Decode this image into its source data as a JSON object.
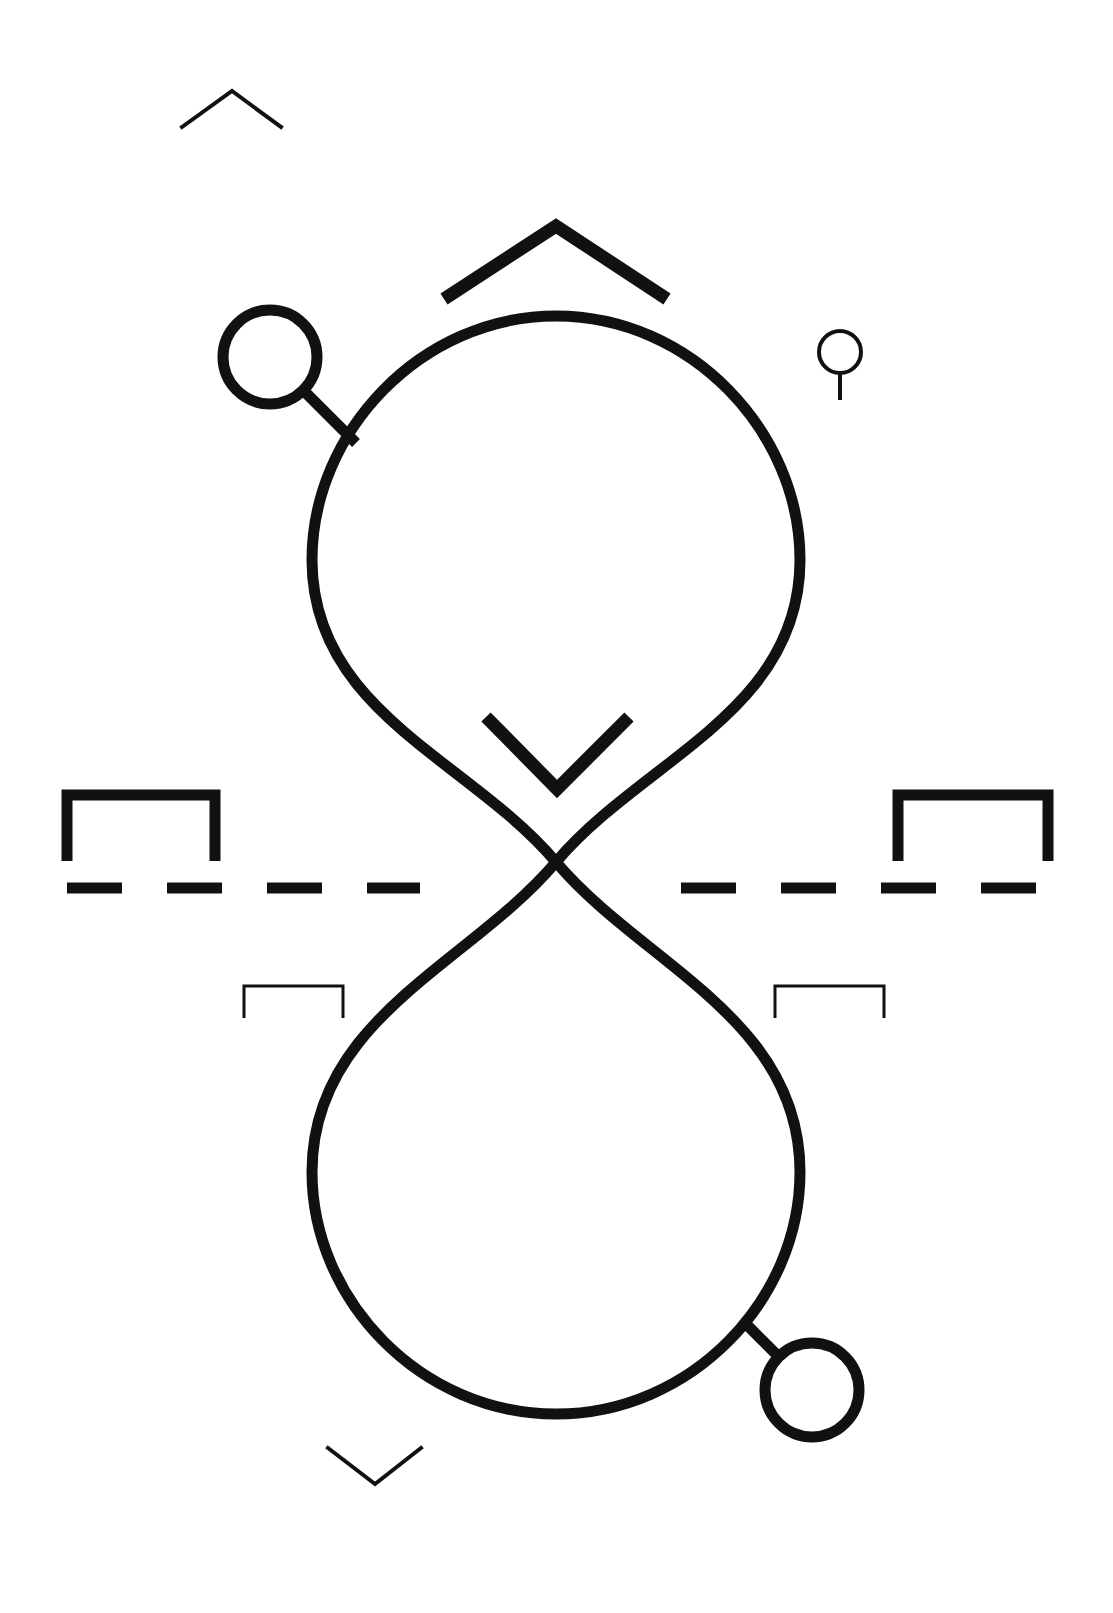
{
  "canvas": {
    "width": 1113,
    "height": 1613,
    "background_color": "#ffffff",
    "stroke_color": "#111111",
    "title": "Abstract line-art composition"
  },
  "figure": {
    "name": "infinity-lemniscate-diagram",
    "elements": [
      {
        "id": "lemniscate",
        "label": "Vertical figure-eight loop",
        "stroke_width": 11,
        "crossing_point": [
          556,
          862
        ],
        "top_lobe_center": [
          556,
          560
        ],
        "top_lobe_radius": 245,
        "bottom_lobe_center": [
          556,
          1170
        ],
        "bottom_lobe_radius": 245
      },
      {
        "id": "top-left-node-circle",
        "label": "Top-left node circle",
        "cx": 270,
        "cy": 357,
        "r": 47,
        "stroke_width": 11
      },
      {
        "id": "top-left-node-stem",
        "label": "Top-left node connector",
        "from": [
          305,
          392
        ],
        "to": [
          352,
          438
        ],
        "stroke_width": 11
      },
      {
        "id": "bottom-right-node-circle",
        "label": "Bottom-right node circle",
        "cx": 812,
        "cy": 1390,
        "r": 47,
        "stroke_width": 11
      },
      {
        "id": "bottom-right-node-stem",
        "label": "Bottom-right node connector",
        "from": [
          744,
          1322
        ],
        "to": [
          779,
          1357
        ],
        "stroke_width": 11
      },
      {
        "id": "small-ring",
        "label": "Small ring with stem, upper right",
        "cx": 840,
        "cy": 352,
        "r": 21,
        "stem_to": [
          840,
          400
        ],
        "stroke_width": 4
      },
      {
        "id": "chevron-top-small",
        "label": "Small thin chevron, top left",
        "points": "182,127 232,91 281,127",
        "stroke_width": 4
      },
      {
        "id": "chevron-top-large",
        "label": "Large bold chevron above top lobe",
        "points": "444,299 556,226 667,299",
        "stroke_width": 13
      },
      {
        "id": "chevron-inner-v",
        "label": "Bold V chevron inside top lobe",
        "points": "486,717 557,789 629,717",
        "stroke_width": 13
      },
      {
        "id": "chevron-bottom-small",
        "label": "Small thin chevron, bottom left",
        "points": "328,1448 375,1484 421,1448",
        "stroke_width": 4
      },
      {
        "id": "bracket-left-bold",
        "label": "Bold bracket, left of dashed rule",
        "points": "67,861 67,795 215,795 215,861",
        "stroke_width": 11
      },
      {
        "id": "bracket-right-bold",
        "label": "Bold bracket, right of dashed rule",
        "points": "898,861 898,795 1048,795 1048,861",
        "stroke_width": 11
      },
      {
        "id": "bracket-left-thin",
        "label": "Thin bracket, below dashed rule left",
        "points": "244,1018 244,986 343,986 343,1018",
        "stroke_width": 3
      },
      {
        "id": "bracket-right-thin",
        "label": "Thin bracket, below dashed rule right",
        "points": "775,1018 775,986 884,986 884,1018",
        "stroke_width": 3
      },
      {
        "id": "dashed-rule-left",
        "label": "Dashed horizontal rule, left segment",
        "y": 888,
        "x_start": 67,
        "x_end": 420,
        "dash": 55,
        "gap": 45,
        "stroke_width": 11
      },
      {
        "id": "dashed-rule-right",
        "label": "Dashed horizontal rule, right segment",
        "y": 888,
        "x_start": 681,
        "x_end": 1048,
        "dash": 55,
        "gap": 45,
        "stroke_width": 11
      }
    ]
  },
  "legend": {
    "stroke_color_hex": "#111111",
    "background_hex": "#ffffff",
    "accent_hex": "#000000"
  }
}
